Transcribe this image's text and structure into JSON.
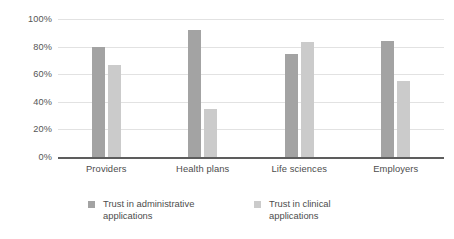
{
  "chart_data": {
    "type": "bar",
    "title": "",
    "xlabel": "",
    "ylabel": "",
    "ylim": [
      0,
      100
    ],
    "yticks": [
      "0%",
      "20%",
      "40%",
      "60%",
      "80%",
      "100%"
    ],
    "ytick_values": [
      0,
      20,
      40,
      60,
      80,
      100
    ],
    "grid": true,
    "legend_position": "bottom",
    "categories": [
      "Providers",
      "Health plans",
      "Life sciences",
      "Employers"
    ],
    "series": [
      {
        "name": "Trust in administrative applications",
        "name_line1": "Trust in administrative",
        "name_line2": "applications",
        "color": "#a3a3a3",
        "values": [
          80,
          92,
          75,
          84
        ]
      },
      {
        "name": "Trust in clinical applications",
        "name_line1": "Trust in clinical",
        "name_line2": "applications",
        "color": "#cbcbcb",
        "values": [
          67,
          35,
          83,
          55
        ]
      }
    ]
  }
}
